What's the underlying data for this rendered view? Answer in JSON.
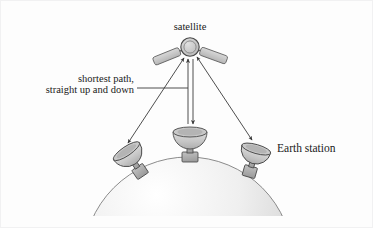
{
  "figure": {
    "kind": "satellite-communication-diagram",
    "background_color": "#fdfdfd",
    "border_color": "#f2f2f3"
  },
  "labels": {
    "satellite": "satellite",
    "earth_station": "Earth station",
    "shortest_path_line1": "shortest path,",
    "shortest_path_line2": "straight up and down"
  },
  "colors": {
    "stroke": "#3a3a3a",
    "dish_fill_light": "#e3e3e3",
    "dish_fill_dark": "#b9b9b9",
    "panel_fill": "#c9c9c9",
    "body_fill": "#cfcfcf",
    "earth_light": "#fbfbfb",
    "earth_dark": "#c4c4c4",
    "text": "#1a1a1a"
  },
  "satellite": {
    "name": "satellite",
    "body_center_x": 190,
    "body_center_y": 47,
    "body_radius": 9,
    "panels": 2
  },
  "earth": {
    "name": "earth-dome",
    "center_x": 188,
    "center_y": 262,
    "radius": 105
  },
  "stations": [
    {
      "id": "left",
      "name": "earth-station-left",
      "x": 127,
      "y": 150,
      "tilt": -38
    },
    {
      "id": "center",
      "name": "earth-station-center",
      "x": 190,
      "y": 131,
      "tilt": 0
    },
    {
      "id": "right",
      "name": "earth-station-right",
      "x": 255,
      "y": 147,
      "tilt": 22
    }
  ],
  "paths": [
    {
      "id": "left-link",
      "name": "signal-path-left",
      "from": "satellite",
      "to": "earth-station-left",
      "arrowheads": "both"
    },
    {
      "id": "center-link",
      "name": "signal-path-center",
      "from": "satellite",
      "to": "earth-station-center",
      "arrowheads": "both",
      "note": "shortest path, straight up and down"
    },
    {
      "id": "right-link",
      "name": "signal-path-right",
      "from": "satellite",
      "to": "earth-station-right",
      "arrowheads": "both"
    }
  ]
}
